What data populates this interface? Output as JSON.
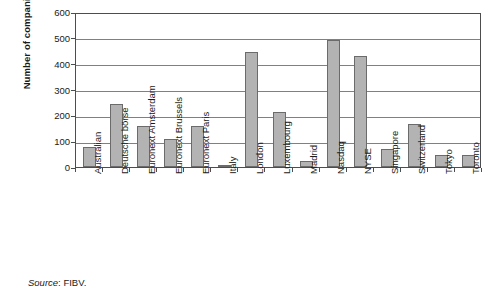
{
  "chart_data": {
    "type": "bar",
    "title": "",
    "xlabel": "",
    "ylabel": "Number of companies",
    "ylim": [
      0,
      600
    ],
    "ytick_step": 100,
    "yticks": [
      "0",
      "100",
      "200",
      "300",
      "400",
      "500",
      "600"
    ],
    "grid": true,
    "legend": false,
    "bar_fill": "#b3b3b3",
    "bar_border": "#6b6b6b",
    "categories": [
      "Australian",
      "Deutsche börse",
      "Euronext Amsterdam",
      "Euronext Brussels",
      "Euronext Paris",
      "Italy",
      "London",
      "Luxembourg",
      "Madrid",
      "Nasdaq",
      "NYSE",
      "Singapore",
      "Switzerland",
      "Tokyo",
      "Toronto"
    ],
    "values": [
      78,
      245,
      158,
      110,
      158,
      8,
      447,
      212,
      22,
      490,
      430,
      70,
      165,
      45,
      48
    ]
  },
  "source_note": {
    "label": "Source",
    "text": ": FIBV."
  }
}
